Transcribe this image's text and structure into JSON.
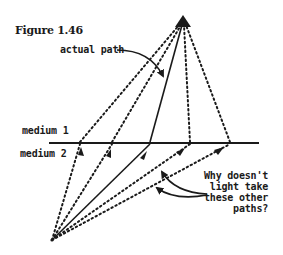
{
  "figure": {
    "title": "Figure 1.46",
    "labels": {
      "actual_path": "actual path",
      "medium_1": "medium 1",
      "medium_2": "medium 2",
      "question_lines": [
        "Why doesn't",
        "light take",
        "these other",
        "paths?"
      ]
    },
    "colors": {
      "ink": "#1a1a1a",
      "background": "#ffffff"
    },
    "geometry": {
      "source_point": [
        52,
        240
      ],
      "target_point": [
        183,
        22
      ],
      "interface_y": 143,
      "interface_x_range": [
        49,
        259
      ],
      "crossing_points_x": [
        80,
        112,
        150,
        190,
        230
      ],
      "actual_path_crossing_x": 150
    }
  }
}
